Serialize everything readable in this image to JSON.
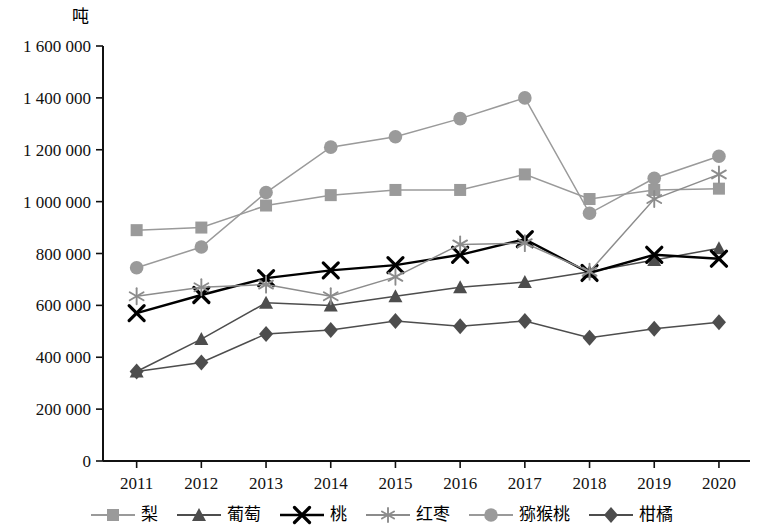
{
  "chart_data": {
    "type": "line",
    "title": "",
    "subtitle": "",
    "xlabel": "",
    "ylabel": "吨",
    "ylim": [
      0,
      1600000
    ],
    "xlim": [
      "2011",
      "2020"
    ],
    "grid": false,
    "legend_position": "bottom",
    "ytick_labels": [
      "1 600 000",
      "1 400 000",
      "1 200 000",
      "1 000 000",
      "800 000",
      "600 000",
      "400 000",
      "200 000",
      "0"
    ],
    "ytick_values": [
      1600000,
      1400000,
      1200000,
      1000000,
      800000,
      600000,
      400000,
      200000,
      0
    ],
    "categories": [
      "2011",
      "2012",
      "2013",
      "2014",
      "2015",
      "2016",
      "2017",
      "2018",
      "2019",
      "2020"
    ],
    "series": [
      {
        "name": "梨",
        "marker": "square",
        "color": "#9a9a9a",
        "values": [
          890000,
          900000,
          985000,
          1025000,
          1045000,
          1045000,
          1105000,
          1010000,
          1045000,
          1050000
        ]
      },
      {
        "name": "葡萄",
        "marker": "triangle",
        "color": "#4d4d4d",
        "values": [
          345000,
          470000,
          610000,
          600000,
          635000,
          670000,
          690000,
          730000,
          775000,
          820000
        ]
      },
      {
        "name": "桃",
        "marker": "x",
        "color": "#000000",
        "values": [
          570000,
          640000,
          705000,
          735000,
          755000,
          795000,
          855000,
          725000,
          795000,
          780000
        ]
      },
      {
        "name": "红枣",
        "marker": "asterisk",
        "color": "#8c8c8c",
        "values": [
          635000,
          670000,
          680000,
          635000,
          710000,
          835000,
          840000,
          730000,
          1010000,
          1105000
        ]
      },
      {
        "name": "猕猴桃",
        "marker": "circle",
        "color": "#9a9a9a",
        "values": [
          745000,
          825000,
          1035000,
          1210000,
          1250000,
          1320000,
          1400000,
          955000,
          1090000,
          1175000
        ]
      },
      {
        "name": "柑橘",
        "marker": "diamond",
        "color": "#4d4d4d",
        "values": [
          345000,
          380000,
          490000,
          505000,
          540000,
          520000,
          540000,
          475000,
          510000,
          535000
        ]
      }
    ]
  },
  "axis": {
    "y_unit_label": "吨"
  },
  "legend": {
    "items": [
      {
        "label": "梨"
      },
      {
        "label": "葡萄"
      },
      {
        "label": "桃"
      },
      {
        "label": "红枣"
      },
      {
        "label": "猕猴桃"
      },
      {
        "label": "柑橘"
      }
    ]
  }
}
